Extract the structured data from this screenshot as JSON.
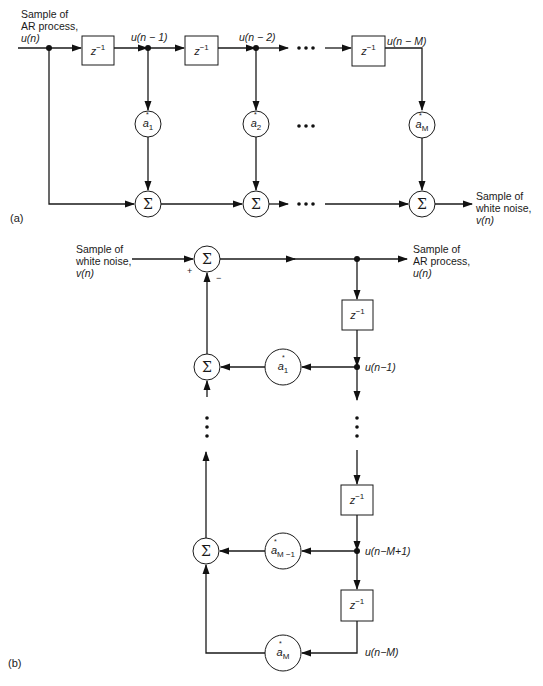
{
  "diagram": {
    "part_a": {
      "label": "(a)",
      "input_label": [
        "Sample of",
        "AR process,",
        "u(n)"
      ],
      "output_label": [
        "Sample of",
        "white noise,",
        "v(n)"
      ],
      "delay_symbol": "z",
      "delay_exponent": "−1",
      "tap_labels": [
        "u(n − 1)",
        "u(n − 2)",
        "u(n − M)"
      ],
      "coefficients": [
        {
          "base": "a",
          "sub": "1",
          "star": "*"
        },
        {
          "base": "a",
          "sub": "2",
          "star": "*"
        },
        {
          "base": "a",
          "sub": "M",
          "star": "*"
        }
      ],
      "summer_symbol": "Σ",
      "ellipsis": "• • •"
    },
    "part_b": {
      "label": "(b)",
      "input_label": [
        "Sample of",
        "white noise,",
        "v(n)"
      ],
      "output_label": [
        "Sample of",
        "AR process,",
        "u(n)"
      ],
      "delay_symbol": "z",
      "delay_exponent": "−1",
      "tap_labels": [
        "u(n−1)",
        "u(n−M+1)",
        "u(n−M)"
      ],
      "coefficients": [
        {
          "base": "a",
          "sub": "1",
          "star": "*"
        },
        {
          "base": "a",
          "sub": "M −1",
          "star": "*"
        },
        {
          "base": "a",
          "sub": "M",
          "star": "*"
        }
      ],
      "summer_symbol": "Σ",
      "plus_sign": "+",
      "minus_sign": "−",
      "vertical_ellipsis": "⋮"
    }
  }
}
